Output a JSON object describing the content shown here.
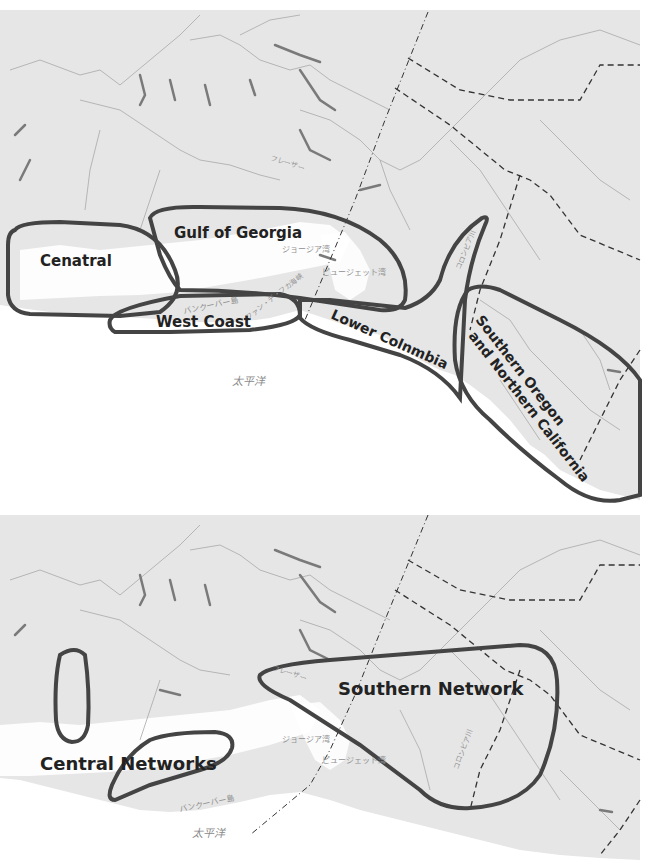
{
  "colors": {
    "land": "#e6e6e6",
    "ocean": "#ffffff",
    "outline": "#444444",
    "lakes": "#7a7a7a",
    "rivers": "#a8a8a8",
    "label": "#222222",
    "jp_label": "#8a8a8a"
  },
  "top_map": {
    "regions": [
      {
        "name": "Cenatral"
      },
      {
        "name": "Gulf of Georgia"
      },
      {
        "name": "West Coast"
      },
      {
        "name": "Lower Colnmbia"
      },
      {
        "name": "Southern Oregon",
        "line2": "and Northern California"
      }
    ],
    "place_labels": {
      "fraser": "フレーザー",
      "georgia_strait": "ジョージア湾",
      "puget_sound": "ピュージェット湾",
      "juan_de_fuca": "ファン・デ・フカ海峡",
      "vancouver_island": "バンクーバー島",
      "columbia_river": "コロンビア川",
      "pacific_ocean": "太平洋"
    }
  },
  "bottom_map": {
    "regions": [
      {
        "name": "Central Networks"
      },
      {
        "name": "Southern Network"
      }
    ],
    "place_labels": {
      "fraser": "フレーザー",
      "georgia_strait": "ジョージア湾",
      "puget_sound": "ピュージェット湾",
      "vancouver_island": "バンクーバー島",
      "columbia_river": "コロンビア川",
      "pacific_ocean": "太平洋"
    }
  }
}
